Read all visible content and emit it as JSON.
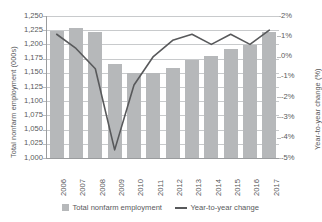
{
  "chart_data": {
    "type": "bar",
    "title": "",
    "xlabel": "",
    "ylabel": "Total nonfarm employment (000s)",
    "y2label": "Year-to-year change (%)",
    "grid": true,
    "legend_position": "bottom",
    "categories": [
      "2006",
      "2007",
      "2008",
      "2009",
      "2010",
      "2011",
      "2012",
      "2013",
      "2014",
      "2015",
      "2016",
      "2017"
    ],
    "ylim": [
      1000,
      1250
    ],
    "yticks": [
      "1,000",
      "1,025",
      "1,050",
      "1,075",
      "1,100",
      "1,125",
      "1,150",
      "1,175",
      "1,200",
      "1,225",
      "1,250"
    ],
    "y2lim": [
      -5,
      2
    ],
    "y2ticks": [
      "-5%",
      "-4%",
      "-3%",
      "-2%",
      "-1%",
      "0%",
      "1%",
      "2%"
    ],
    "series": [
      {
        "name": "Total nonfarm employment",
        "type": "bar",
        "axis": "left",
        "color": "#b6b8ba",
        "values": [
          1224,
          1229,
          1222,
          1166,
          1150,
          1150,
          1159,
          1172,
          1179,
          1192,
          1199,
          1222
        ]
      },
      {
        "name": "Year-to-year change",
        "type": "line",
        "axis": "right",
        "color": "#58595b",
        "values": [
          1.1,
          0.4,
          -0.6,
          -4.6,
          -1.4,
          0.0,
          0.8,
          1.1,
          0.6,
          1.1,
          0.6,
          1.3
        ]
      }
    ]
  },
  "axes": {
    "left_title": "Total nonfarm employment (000s)",
    "right_title": "Year-to-year change (%)"
  },
  "legend": {
    "items": [
      {
        "label": "Total nonfarm employment",
        "marker": "bar-swatch"
      },
      {
        "label": "Year-to-year change",
        "marker": "line-swatch"
      }
    ]
  }
}
